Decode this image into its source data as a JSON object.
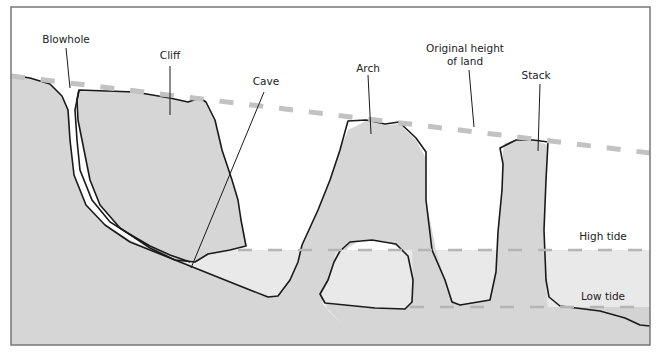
{
  "diagram": {
    "labels": {
      "blowhole": "Blowhole",
      "cliff": "Cliff",
      "cave": "Cave",
      "arch": "Arch",
      "original_height_line1": "Original height",
      "original_height_line2": "of land",
      "stack": "Stack",
      "high_tide": "High tide",
      "low_tide": "Low tide"
    },
    "colors": {
      "rock": "#d6d6d6",
      "water": "#e9e9e9",
      "seabed": "#d0d0d0",
      "outline": "#1a1a1a",
      "dashed_line": "#bdbdbd",
      "frame": "#777777",
      "sky": "#ffffff"
    }
  }
}
